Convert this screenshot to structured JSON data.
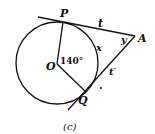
{
  "figure": {
    "caption": "(c)",
    "colors": {
      "stroke": "#111111",
      "background": "#ffffff"
    },
    "labels": {
      "P": "P",
      "A": "A",
      "O": "O",
      "Q": "Q",
      "t": "t",
      "t_prime": "t′",
      "x": "x",
      "y": "y",
      "central_angle": "140°"
    },
    "geometry": {
      "circle": {
        "center": "O",
        "radius_px": 41
      },
      "tangent_points": [
        "P",
        "Q"
      ],
      "external_point": "A",
      "central_angle_POQ_deg": 140,
      "tangent_segments": [
        {
          "from": "P",
          "to": "A",
          "label": "t"
        },
        {
          "from": "Q",
          "to": "A",
          "label": "t′"
        }
      ],
      "arc_label": "x",
      "angle_at_A_label": "y"
    }
  }
}
